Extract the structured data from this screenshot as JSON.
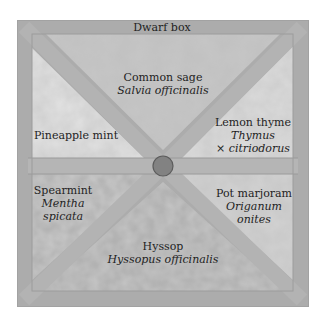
{
  "diagram": {
    "type": "herb-garden-plan",
    "colors": {
      "paper": "#ffffff",
      "frame": "#a9a9a9",
      "path": "#b4b4b4",
      "bed_light": "#d9d9d9",
      "bed_mid": "#c8c8c8",
      "bed_dark": "#bdbdbd",
      "center_stone": "#7e7e7e",
      "text": "#1e1e1e"
    },
    "border": {
      "label": "Dwarf box"
    },
    "beds": [
      {
        "id": "top",
        "common": "Common sage",
        "latin": "Salvia officinalis"
      },
      {
        "id": "upper-left",
        "common": "Pineapple mint",
        "latin": ""
      },
      {
        "id": "upper-right",
        "common": "Lemon thyme",
        "latin": "Thymus",
        "latin2": "× citriodorus"
      },
      {
        "id": "lower-left",
        "common": "Spearmint",
        "latin": "Mentha",
        "latin2": "spicata"
      },
      {
        "id": "lower-right",
        "common": "Pot marjoram",
        "latin": "Origanum",
        "latin2": "onites"
      },
      {
        "id": "bottom",
        "common": "Hyssop",
        "latin": "Hyssopus officinalis"
      }
    ]
  }
}
